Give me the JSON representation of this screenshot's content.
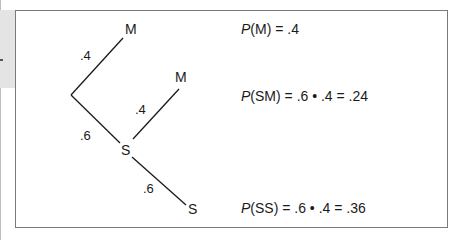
{
  "diagram": {
    "type": "probability-tree",
    "nodes": {
      "first_m": {
        "label": "M"
      },
      "first_s": {
        "label": "S"
      },
      "second_m": {
        "label": "M"
      },
      "second_s": {
        "label": "S"
      }
    },
    "edges": [
      {
        "from": "root",
        "to": "first_m",
        "prob": ".4"
      },
      {
        "from": "root",
        "to": "first_s",
        "prob": ".6"
      },
      {
        "from": "first_s",
        "to": "second_m",
        "prob": ".4"
      },
      {
        "from": "first_s",
        "to": "second_s",
        "prob": ".6"
      }
    ],
    "formulas": [
      {
        "p": "P",
        "arg": "(M)",
        "rest": " = .4"
      },
      {
        "p": "P",
        "arg": "(SM)",
        "rest": " = .6 • .4 = .24"
      },
      {
        "p": "P",
        "arg": "(SS)",
        "rest": " = .6 • .4 = .36"
      }
    ]
  },
  "colors": {
    "line": "#1a1a1a",
    "frame": "#7a7a7a",
    "side_strip": "#e4e4e4"
  }
}
